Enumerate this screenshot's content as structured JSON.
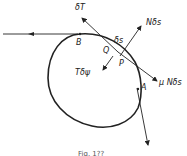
{
  "figure": {
    "caption": "Fig. 1??",
    "labels": {
      "deltaT": "δT",
      "N_delta_s": "Nδs",
      "delta_s": "δs",
      "B": "B",
      "Q": "Q",
      "P": "P",
      "T_delta_psi": "Tδψ",
      "mu_N_delta_s": "μ Nδs",
      "A": "A"
    },
    "colors": {
      "stroke": "#222222",
      "background": "#ffffff"
    }
  }
}
